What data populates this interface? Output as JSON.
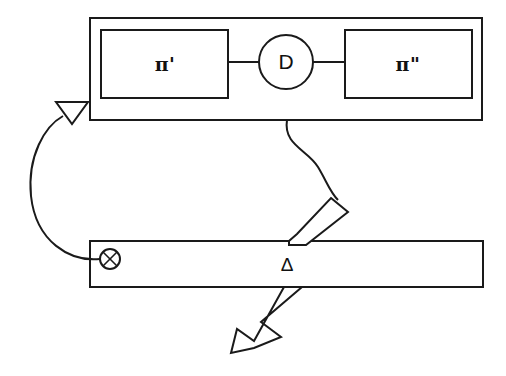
{
  "diagram": {
    "background_color": "#ffffff",
    "line_color": "#1a1a1a",
    "outer_container": {
      "name": "outer-container",
      "x": 90,
      "y": 18,
      "width": 392,
      "height": 102
    },
    "blocks": [
      {
        "id": "pi-prime",
        "label": "π'",
        "x": 101,
        "y": 30,
        "width": 127,
        "height": 68,
        "center_x": 165,
        "center_y": 64
      },
      {
        "id": "pi-double-prime",
        "label": "π\"",
        "x": 345,
        "y": 30,
        "width": 127,
        "height": 68,
        "center_x": 408,
        "center_y": 64
      }
    ],
    "node": {
      "id": "node-d",
      "label": "D",
      "center_x": 286,
      "center_y": 62,
      "radius": 27
    },
    "connectors": [
      {
        "id": "link-pi-prime-to-d",
        "x1": 228,
        "y1": 62,
        "x2": 259,
        "y2": 62
      },
      {
        "id": "link-d-to-pi-double-prime",
        "x1": 313,
        "y1": 62,
        "x2": 345,
        "y2": 62
      }
    ],
    "bar": {
      "id": "delta-bar",
      "label": "Δ",
      "x": 90,
      "y": 241,
      "width": 393,
      "height": 46,
      "label_x": 287,
      "label_y": 265
    },
    "cross_node": {
      "id": "circled-cross",
      "symbol": "⊗",
      "center_x": 110,
      "center_y": 259,
      "radius": 10
    },
    "feedback_arrow": {
      "id": "feedback-curve",
      "description": "curved feedback from circled-cross up to outer container",
      "from": "circled-cross",
      "to": "outer-container",
      "arrowhead": "hollow-triangle"
    },
    "output_arrow": {
      "id": "output-block-arrow",
      "description": "hollow block arrow from D node through delta bar pointing down-left",
      "arrowhead": "hollow-block",
      "tip_x": 228,
      "tip_y": 352
    },
    "wavy_connector": {
      "id": "wavy-connector",
      "description": "S-shaped curve from outer container bottom to block arrow tail"
    }
  }
}
